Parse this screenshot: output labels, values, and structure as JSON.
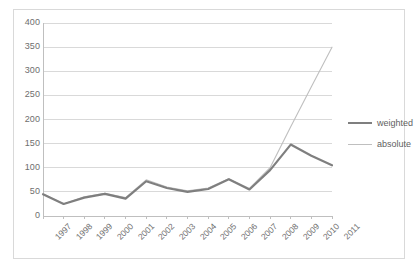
{
  "chart_data": {
    "type": "line",
    "title": "",
    "xlabel": "",
    "ylabel": "",
    "categories": [
      "1997",
      "1998",
      "1999",
      "2000",
      "2001",
      "2002",
      "2003",
      "2004",
      "2005",
      "2006",
      "2007",
      "2008",
      "2009",
      "2010",
      "2011"
    ],
    "ylim": [
      0,
      400
    ],
    "ytick_labels": [
      "400",
      "350",
      "300",
      "250",
      "200",
      "150",
      "100",
      "50",
      "0"
    ],
    "ytick_values": [
      400,
      350,
      300,
      250,
      200,
      150,
      100,
      50,
      0
    ],
    "grid": true,
    "legend_position": "right",
    "series": [
      {
        "name": "weighted",
        "color": "#7f7f7f",
        "line_width": 2.2,
        "values": [
          45,
          25,
          38,
          46,
          36,
          72,
          58,
          50,
          56,
          76,
          55,
          95,
          148,
          125,
          105
        ]
      },
      {
        "name": "absolute",
        "color": "#bfbfbf",
        "line_width": 1.1,
        "values": [
          46,
          25,
          40,
          47,
          38,
          75,
          60,
          52,
          58,
          77,
          57,
          100,
          185,
          268,
          350
        ]
      }
    ]
  },
  "legend": {
    "items": [
      {
        "label": "weighted"
      },
      {
        "label": "absolute"
      }
    ]
  },
  "colors": {
    "weighted": "#7f7f7f",
    "absolute": "#bfbfbf",
    "grid": "#d9d9d9",
    "axis": "#bfbfbf",
    "text": "#6e6e6e",
    "border": "#d9d9d9",
    "background": "#ffffff"
  }
}
